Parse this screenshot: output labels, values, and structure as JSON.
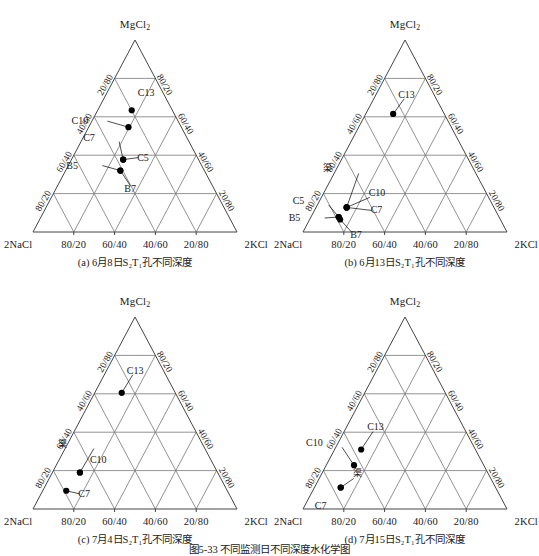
{
  "figure": {
    "main_caption": "图5-33 不同监测日不同深度水化学图",
    "apex_label": "MgCl2",
    "apex_label_html": "MgCl₂",
    "left_corner_label": "2NaCl",
    "right_corner_label": "2KCl",
    "bottom_ticks": [
      "80/20",
      "60/40",
      "40/60",
      "20/80"
    ],
    "left_ticks": [
      "20/80",
      "40/60",
      "60/40",
      "80/20"
    ],
    "right_ticks": [
      "80/20",
      "60/40",
      "40/60",
      "20/80"
    ],
    "line_color": "#666666",
    "point_color": "#000000",
    "axis_color": "#555555"
  },
  "chart_data": {
    "type": "scatter",
    "title": "图5-33 不同监测日不同深度水化学图",
    "subtype": "ternary",
    "axes": {
      "top": "MgCl2",
      "bottom_left": "2NaCl",
      "bottom_right": "2KCl",
      "tick_format": "ratio",
      "ticks": [
        "20/80",
        "40/60",
        "60/40",
        "80/20"
      ],
      "grid": true,
      "range": [
        0,
        100
      ]
    },
    "legend_position": "none",
    "panels": [
      {
        "id": "a",
        "caption": "(a) 6月8日S₂T₁孔不同深度",
        "caption_plain": "(a) 6月8日S2T1孔不同深度",
        "points": [
          {
            "label": "C13",
            "x": 0.484,
            "y": 0.366,
            "label_dx": 6,
            "label_dy": -17,
            "leader": false
          },
          {
            "label": "C10",
            "x": 0.468,
            "y": 0.454,
            "label_dx": -37,
            "label_dy": -6,
            "leader": true
          },
          {
            "label": "C7",
            "x": 0.442,
            "y": 0.623,
            "label_dx": -20,
            "label_dy": -22,
            "leader": true
          },
          {
            "label": "C5",
            "x": 0.442,
            "y": 0.623,
            "label_dx": 14,
            "label_dy": -2,
            "leader": true
          },
          {
            "label": "B5",
            "x": 0.428,
            "y": 0.68,
            "label_dx": -34,
            "label_dy": -5,
            "leader": true
          },
          {
            "label": "B7",
            "x": 0.428,
            "y": 0.68,
            "label_dx": 4,
            "label_dy": 18,
            "leader": true
          }
        ]
      },
      {
        "id": "b",
        "caption": "(b) 6月13日S₂T₁孔不同深度",
        "caption_plain": "(b) 6月13日S2T1孔不同深度",
        "points": [
          {
            "label": "C13",
            "x": 0.442,
            "y": 0.385,
            "label_dx": 5,
            "label_dy": -19,
            "leader": true
          },
          {
            "label": "渠",
            "x": 0.214,
            "y": 0.872,
            "label_dx": -4,
            "label_dy": -38,
            "leader": true
          },
          {
            "label": "C10",
            "x": 0.214,
            "y": 0.872,
            "label_dx": 22,
            "label_dy": -14,
            "leader": true
          },
          {
            "label": "C7",
            "x": 0.214,
            "y": 0.872,
            "label_dx": 24,
            "label_dy": 3,
            "leader": true
          },
          {
            "label": "C5",
            "x": 0.175,
            "y": 0.922,
            "label_dx": -26,
            "label_dy": -16,
            "leader": true
          },
          {
            "label": "B5",
            "x": 0.175,
            "y": 0.922,
            "label_dx": -30,
            "label_dy": 1,
            "leader": true
          },
          {
            "label": "B7",
            "x": 0.182,
            "y": 0.935,
            "label_dx": 10,
            "label_dy": 15,
            "leader": true
          }
        ]
      },
      {
        "id": "c",
        "caption": "(c) 7月4日S₂T₁孔不同深度",
        "caption_plain": "(c) 7月4日S2T1孔不同深度",
        "points": [
          {
            "label": "C13",
            "x": 0.435,
            "y": 0.395,
            "label_dx": 5,
            "label_dy": -22,
            "leader": true
          },
          {
            "label": "渠",
            "x": 0.23,
            "y": 0.81,
            "label_dx": -2,
            "label_dy": -28,
            "leader": true
          },
          {
            "label": "C10",
            "x": 0.23,
            "y": 0.81,
            "label_dx": 10,
            "label_dy": -13,
            "leader": false
          },
          {
            "label": "C7",
            "x": 0.163,
            "y": 0.905,
            "label_dx": 12,
            "label_dy": 3,
            "leader": true
          }
        ]
      },
      {
        "id": "d",
        "caption": "(d) 7月15日S₂T₁孔不同深度",
        "caption_plain": "(d) 7月15日S2T1孔不同深度",
        "points": [
          {
            "label": "C13",
            "x": 0.285,
            "y": 0.69,
            "label_dx": 6,
            "label_dy": -22,
            "leader": true
          },
          {
            "label": "C10",
            "x": 0.25,
            "y": 0.772,
            "label_dx": -28,
            "label_dy": -22,
            "leader": true
          },
          {
            "label": "渠",
            "x": 0.185,
            "y": 0.888,
            "label_dx": 12,
            "label_dy": -13,
            "leader": true
          },
          {
            "label": "C7",
            "x": 0.185,
            "y": 0.888,
            "label_dx": -6,
            "label_dy": 19,
            "leader": false
          }
        ]
      }
    ]
  }
}
